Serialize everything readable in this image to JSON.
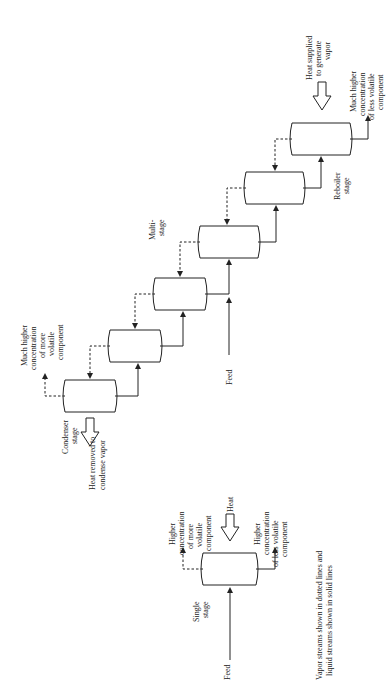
{
  "diagram": {
    "orientation": "rotated 90 degrees counter-clockwise",
    "single_stage": {
      "label": "Single stage",
      "feed_label": "Feed",
      "heat_label": "Heat",
      "top_product": "Higher concentration of more volatile component",
      "bottom_product": "Higher concentration of less volatile component"
    },
    "multi_stage": {
      "label": "Multi-stage",
      "feed_label": "Feed",
      "stage_count": 6,
      "condenser_label": "Condenser stage",
      "condenser_heat": "Heat removed to condense vapor",
      "reboiler_label": "Reboiler stage",
      "reboiler_heat": "Heat supplied to generate vapor",
      "top_product": "Much higher concentration of more volatile component",
      "bottom_product": "Much higher concentration of less volatile component"
    },
    "legend": "Vapor streams shown in dotted lines and liquid streams shown in solid lines"
  }
}
